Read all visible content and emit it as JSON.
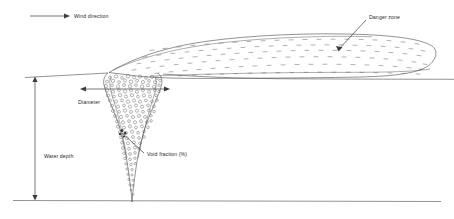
{
  "figure": {
    "background_color": "#ffffff",
    "line_color": "#4a4a4a",
    "text_color": "#2b2b2b"
  },
  "labels": {
    "wind_direction": "Wind direction",
    "danger_zone": "Danger zone",
    "diameter": "Diameter",
    "void_fraction": "Void fraction (%)",
    "water_depth": "Water depth"
  },
  "annotations": {
    "wind_arrow": {
      "from_x": 30,
      "from_y": 16,
      "to_x": 68,
      "to_y": 16,
      "direction": "right"
    },
    "diameter_arrow": {
      "from_x": 82,
      "from_y": 89,
      "to_x": 168,
      "to_y": 89,
      "direction": "both"
    },
    "water_depth_arrow": {
      "from_x": 35,
      "from_y": 78,
      "to_x": 35,
      "to_y": 199,
      "direction": "both"
    },
    "danger_zone_leader": {
      "from_x": 340,
      "from_y": 49,
      "to_x": 366,
      "to_y": 20
    },
    "void_fraction_leader": {
      "from_x": 122,
      "from_y": 133,
      "to_x": 143,
      "to_y": 152
    }
  },
  "geometry": {
    "water_surface_y": 77,
    "seabed_y": 200,
    "plume_tip_x": 132,
    "plume_tip_y": 202,
    "danger_zone_right_x": 434,
    "danger_zone_top_y": 33
  }
}
